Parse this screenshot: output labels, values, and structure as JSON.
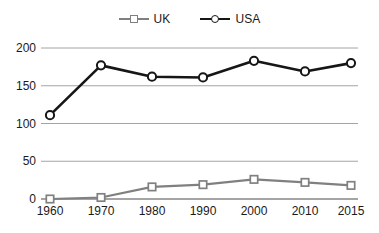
{
  "chart_data": {
    "type": "line",
    "title": "",
    "subtitle": "",
    "xlabel": "",
    "ylabel": "",
    "categories": [
      "1960",
      "1970",
      "1980",
      "1990",
      "2000",
      "2010",
      "2015"
    ],
    "x": [
      1960,
      1970,
      1980,
      1990,
      2000,
      2010,
      2015
    ],
    "series": [
      {
        "name": "UK",
        "color": "#808080",
        "marker": "square",
        "values": [
          0,
          2,
          16,
          19,
          26,
          22,
          18
        ]
      },
      {
        "name": "USA",
        "color": "#161616",
        "marker": "circle",
        "values": [
          111,
          177,
          162,
          161,
          183,
          169,
          180
        ]
      }
    ],
    "ylim": [
      0,
      200
    ],
    "yticks": [
      0,
      50,
      100,
      150,
      200
    ],
    "ytick_labels": [
      "0",
      "50",
      "100",
      "150",
      "200"
    ],
    "xtick_labels": [
      "1960",
      "1970",
      "1980",
      "1990",
      "2000",
      "2010",
      "2015"
    ],
    "grid": true,
    "grid_axis": "y",
    "legend_position": "top-center",
    "legend_entries": [
      "UK",
      "USA"
    ]
  },
  "style": {
    "background": "#ffffff",
    "grid_color": "#9a9a9a",
    "axis_color": "#4a4a4a",
    "text_color": "#1a1a1a",
    "uk_color": "#808080",
    "usa_color": "#161616"
  }
}
